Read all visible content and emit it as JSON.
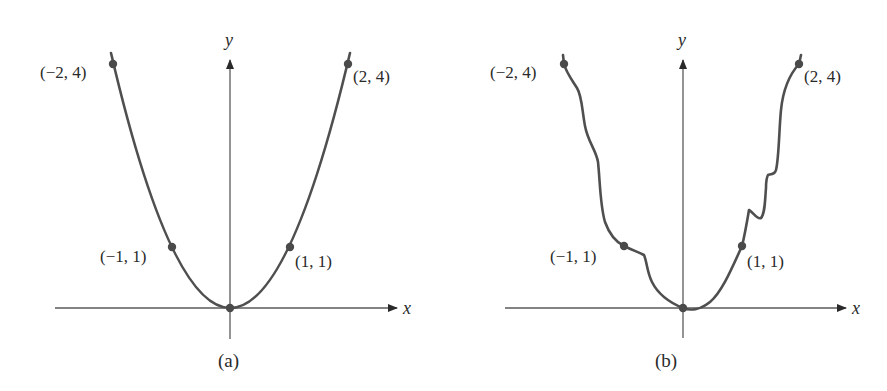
{
  "figure": {
    "panels": [
      {
        "caption": "(a)",
        "x_axis_label": "x",
        "y_axis_label": "y",
        "points": [
          {
            "label": "(−2, 4)",
            "x": -2,
            "y": 4
          },
          {
            "label": "(−1, 1)",
            "x": -1,
            "y": 1
          },
          {
            "label": "(1, 1)",
            "x": 1,
            "y": 1
          },
          {
            "label": "(2, 4)",
            "x": 2,
            "y": 4
          },
          {
            "label": "",
            "x": 0,
            "y": 0
          }
        ],
        "curve": "smooth parabola y = x^2"
      },
      {
        "caption": "(b)",
        "x_axis_label": "x",
        "y_axis_label": "y",
        "points": [
          {
            "label": "(−2, 4)",
            "x": -2,
            "y": 4
          },
          {
            "label": "(−1, 1)",
            "x": -1,
            "y": 1
          },
          {
            "label": "(1, 1)",
            "x": 1,
            "y": 1
          },
          {
            "label": "(2, 4)",
            "x": 2,
            "y": 4
          },
          {
            "label": "",
            "x": 0,
            "y": 0
          }
        ],
        "curve": "irregular curve passing through the same five points"
      }
    ]
  },
  "colors": {
    "curve": "#4f4f4f",
    "axis": "#5a5a5a",
    "text": "#2a2a2a"
  }
}
